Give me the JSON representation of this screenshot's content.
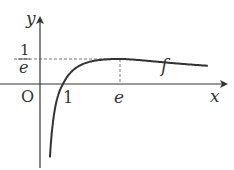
{
  "diagram": {
    "function_name": "f",
    "formula_implied": "f(x) = ln(x)/x",
    "axes": {
      "x_label": "x",
      "y_label": "y",
      "origin_label": "O"
    },
    "ticks": {
      "x_one": "1",
      "x_e": "e",
      "y_num": "1",
      "y_den": "e"
    },
    "maximum_point": {
      "x": "e",
      "y": "1/e"
    },
    "colors": {
      "ink": "#333333",
      "dash": "#555555"
    }
  }
}
